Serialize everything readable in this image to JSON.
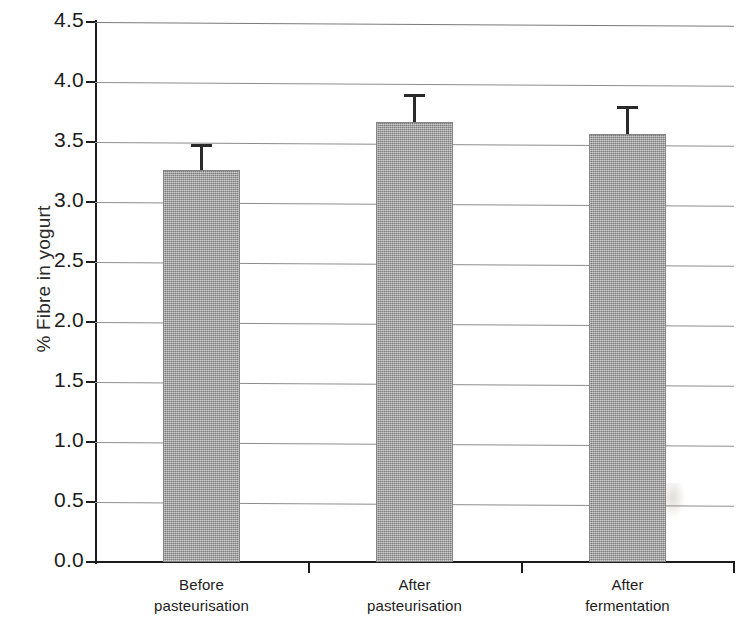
{
  "chart_data": {
    "type": "bar",
    "title": "",
    "xlabel": "",
    "ylabel": "% Fibre in yogurt",
    "categories": [
      "Before pasteurisation",
      "After pasteurisation",
      "After fermentation"
    ],
    "category_lines": [
      [
        "Before",
        "pasteurisation"
      ],
      [
        "After",
        "pasteurisation"
      ],
      [
        "After",
        "fermentation"
      ]
    ],
    "values": [
      3.27,
      3.67,
      3.57
    ],
    "errors": [
      0.21,
      0.23,
      0.23
    ],
    "error_type": "standard error bars (upper only shown)",
    "ylim": [
      0.0,
      4.5
    ],
    "ytick_step": 0.5,
    "ytick_labels": [
      "0.0",
      "0.5",
      "1.0",
      "1.5",
      "2.0",
      "2.5",
      "3.0",
      "3.5",
      "4.0",
      "4.5"
    ],
    "ytick_values": [
      0.0,
      0.5,
      1.0,
      1.5,
      2.0,
      2.5,
      3.0,
      3.5,
      4.0,
      4.5
    ],
    "grid": true,
    "grid_axis": "y",
    "legend": false,
    "legend_position": "none",
    "series": [
      {
        "name": "% Fibre in yogurt",
        "values": [
          3.27,
          3.67,
          3.57
        ],
        "errors": [
          0.21,
          0.23,
          0.23
        ]
      }
    ]
  },
  "style": {
    "bar_fill": "#9a9a9a",
    "bar_edge": "#868686",
    "axis_color": "#1c1c1c",
    "grid_color": "#8d8d8d",
    "error_color": "#2a2a2a",
    "background": "#ffffff"
  }
}
